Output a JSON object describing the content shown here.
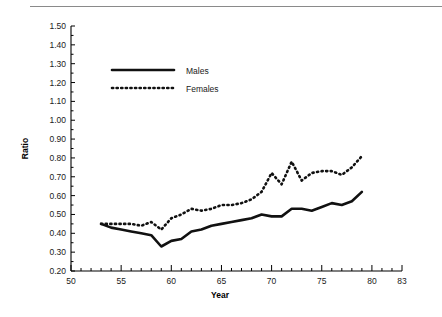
{
  "chart_data": {
    "type": "line",
    "title": "",
    "xlabel": "Year",
    "ylabel": "Ratio",
    "xlim": [
      50,
      83
    ],
    "ylim": [
      0.2,
      1.5
    ],
    "grid": false,
    "legend_position": "upper-left-inside",
    "x_major_ticks": [
      50,
      55,
      60,
      65,
      70,
      75,
      80,
      83
    ],
    "x_tick_labels": [
      "50",
      "55",
      "60",
      "65",
      "70",
      "75",
      "80",
      "83"
    ],
    "x_minor_tick_step": 1,
    "y_ticks": [
      0.2,
      0.3,
      0.4,
      0.5,
      0.6,
      0.7,
      0.8,
      0.9,
      1.0,
      1.1,
      1.2,
      1.3,
      1.4,
      1.5
    ],
    "y_tick_labels": [
      "0.20",
      "0.30",
      "0.40",
      "0.50",
      "0.60",
      "0.70",
      "0.80",
      "0.90",
      "1.00",
      "1.10",
      "1.20",
      "1.30",
      "1.40",
      "1.50"
    ],
    "x": [
      53,
      54,
      55,
      56,
      57,
      58,
      59,
      60,
      61,
      62,
      63,
      64,
      65,
      66,
      67,
      68,
      69,
      70,
      71,
      72,
      73,
      74,
      75,
      76,
      77,
      78,
      79
    ],
    "series": [
      {
        "name": "Males",
        "style": "solid",
        "values": [
          0.45,
          0.43,
          0.42,
          0.41,
          0.4,
          0.39,
          0.33,
          0.36,
          0.37,
          0.41,
          0.42,
          0.44,
          0.45,
          0.46,
          0.47,
          0.48,
          0.5,
          0.49,
          0.49,
          0.53,
          0.53,
          0.52,
          0.54,
          0.56,
          0.55,
          0.57,
          0.62
        ]
      },
      {
        "name": "Females",
        "style": "dotted",
        "values": [
          0.45,
          0.45,
          0.45,
          0.45,
          0.44,
          0.46,
          0.42,
          0.48,
          0.5,
          0.53,
          0.52,
          0.53,
          0.55,
          0.55,
          0.56,
          0.58,
          0.62,
          0.72,
          0.66,
          0.78,
          0.68,
          0.72,
          0.73,
          0.73,
          0.71,
          0.75,
          0.81
        ]
      }
    ]
  },
  "legend": {
    "items": [
      {
        "label": "Males",
        "style": "solid"
      },
      {
        "label": "Females",
        "style": "dotted"
      }
    ]
  }
}
